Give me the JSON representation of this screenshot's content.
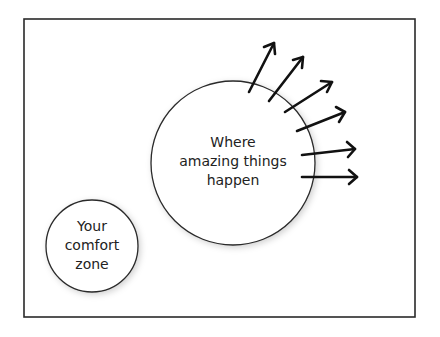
{
  "diagram": {
    "colors": {
      "stroke": "#2a2a2a",
      "arrow": "#111111",
      "text": "#222222",
      "background": "#ffffff"
    },
    "big_circle": {
      "lines": [
        "Where",
        "amazing things",
        "happen"
      ]
    },
    "small_circle": {
      "lines": [
        "Your",
        "comfort",
        "zone"
      ]
    },
    "arrows_count": 6
  }
}
